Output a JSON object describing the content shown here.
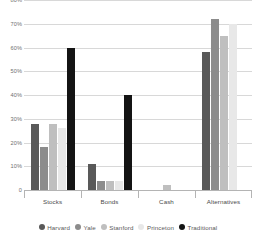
{
  "chart_data": {
    "type": "bar",
    "title": "",
    "subtitle": "",
    "xlabel": "",
    "ylabel": "",
    "ylim": [
      0,
      80
    ],
    "ytick_step": 10,
    "grid": true,
    "legend_position": "bottom",
    "ytick_labels": [
      "80%",
      "70%",
      "60%",
      "50%",
      "40%",
      "30%",
      "20%",
      "10%",
      "0"
    ],
    "ytick_values": [
      80,
      70,
      60,
      50,
      40,
      30,
      20,
      10,
      0
    ],
    "categories": [
      "Stocks",
      "Bonds",
      "Cash",
      "Alternatives"
    ],
    "series": [
      {
        "name": "Harvard",
        "color": "#595959",
        "values": [
          28,
          11,
          0,
          58
        ]
      },
      {
        "name": "Yale",
        "color": "#8c8c8c",
        "values": [
          18,
          4,
          0,
          72
        ]
      },
      {
        "name": "Stanford",
        "color": "#bfbfbf",
        "values": [
          28,
          4,
          2,
          65
        ]
      },
      {
        "name": "Princeton",
        "color": "#e8e8e8",
        "values": [
          26,
          4,
          0,
          70
        ]
      },
      {
        "name": "Traditional",
        "color": "#141414",
        "values": [
          60,
          40,
          0,
          0
        ]
      }
    ]
  },
  "colors": {
    "gridline": "#d8d8d8",
    "axis": "#b4b4b4",
    "tick_text": "#6f6f6f",
    "category_text": "#4a4a4a",
    "legend_text": "#5a5a5a",
    "background": "#ffffff"
  }
}
